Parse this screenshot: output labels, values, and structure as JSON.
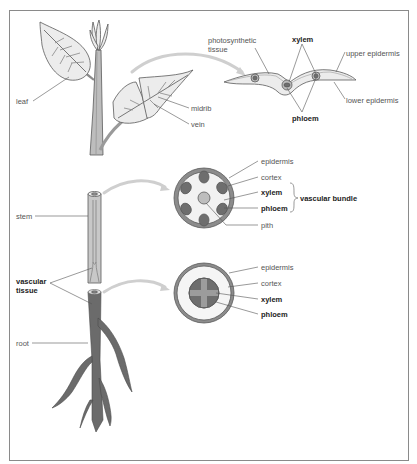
{
  "diagram": {
    "type": "plant-vascular-system",
    "colors": {
      "frame": "#8a8a8a",
      "outline": "#5a5a5a",
      "leaf_fill": "#ececec",
      "stem_fill": "#bdbdbd",
      "root_fill": "#6b6b6b",
      "arrow": "#cfcfcf",
      "vascular_dark": "#6e6e6e",
      "cortex": "#f2f2f2",
      "epidermis_ring": "#8c8c8c",
      "leader_line": "#555555"
    },
    "plant_labels": {
      "leaf": "leaf",
      "midrib": "midrib",
      "vein": "vein",
      "stem": "stem",
      "vascular_tissue": "vascular\ntissue",
      "root": "root"
    },
    "leaf_section": {
      "photosynthetic_tissue": "photosynthetic\ntissue",
      "xylem": "xylem",
      "upper_epidermis": "upper epidermis",
      "lower_epidermis": "lower epidermis",
      "phloem": "phloem"
    },
    "stem_section": {
      "epidermis": "epidermis",
      "cortex": "cortex",
      "xylem": "xylem",
      "phloem": "phloem",
      "vascular_bundle": "vascular bundle",
      "pith": "pith"
    },
    "root_section": {
      "epidermis": "epidermis",
      "cortex": "cortex",
      "xylem": "xylem",
      "phloem": "phloem"
    }
  }
}
